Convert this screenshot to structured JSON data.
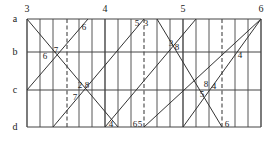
{
  "diagram": {
    "grid": {
      "x_left": 27,
      "x_right": 261,
      "columns": 18,
      "line_color": "#444444",
      "rows": [
        {
          "label": "a",
          "y": 19
        },
        {
          "label": "b",
          "y": 52
        },
        {
          "label": "c",
          "y": 90
        },
        {
          "label": "d",
          "y": 127
        }
      ],
      "major_columns": [
        {
          "label": "3",
          "x": 27
        },
        {
          "label": "4",
          "x": 105
        },
        {
          "label": "5",
          "x": 183
        },
        {
          "label": "6",
          "x": 261
        }
      ],
      "dashed_columns": [
        67,
        144,
        222
      ]
    },
    "lines": [
      {
        "x1": 27,
        "y1": 19,
        "x2": 118,
        "y2": 127
      },
      {
        "x1": 27,
        "y1": 90,
        "x2": 88,
        "y2": 19
      },
      {
        "x1": 53,
        "y1": 127,
        "x2": 144,
        "y2": 19
      },
      {
        "x1": 105,
        "y1": 127,
        "x2": 196,
        "y2": 19
      },
      {
        "x1": 157,
        "y1": 19,
        "x2": 222,
        "y2": 127
      },
      {
        "x1": 144,
        "y1": 127,
        "x2": 261,
        "y2": 19
      },
      {
        "x1": 183,
        "y1": 127,
        "x2": 261,
        "y2": 19
      }
    ],
    "point_labels": [
      {
        "text": "6",
        "x": 84,
        "y": 30
      },
      {
        "text": "7",
        "x": 56,
        "y": 53
      },
      {
        "text": "6",
        "x": 45,
        "y": 59
      },
      {
        "text": "5",
        "x": 137,
        "y": 26
      },
      {
        "text": "3",
        "x": 146,
        "y": 26
      },
      {
        "text": "3",
        "x": 171,
        "y": 46
      },
      {
        "text": "8",
        "x": 177,
        "y": 50
      },
      {
        "text": "4",
        "x": 240,
        "y": 58
      },
      {
        "text": "2",
        "x": 80,
        "y": 88
      },
      {
        "text": "8",
        "x": 87,
        "y": 88
      },
      {
        "text": "7",
        "x": 75,
        "y": 100
      },
      {
        "text": "8",
        "x": 206,
        "y": 87
      },
      {
        "text": "4",
        "x": 214,
        "y": 89
      },
      {
        "text": "5",
        "x": 202,
        "y": 97
      },
      {
        "text": "4",
        "x": 111,
        "y": 127
      },
      {
        "text": "6",
        "x": 135,
        "y": 127
      },
      {
        "text": "5",
        "x": 140,
        "y": 127
      },
      {
        "text": "6",
        "x": 227,
        "y": 127
      }
    ]
  }
}
